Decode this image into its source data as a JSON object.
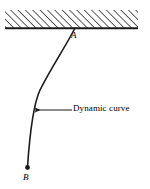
{
  "figure": {
    "background_color": "#ffffff",
    "stroke_color": "#1a1a1a",
    "width": 150,
    "height": 189,
    "wall": {
      "name": "hatched-ceiling",
      "hatch_direction": "forward-slash",
      "hatch_color": "#2a2a2a",
      "x_start": 5,
      "x_end": 138,
      "y_top": 10,
      "y_bottom": 28,
      "baseline_thickness": 2
    },
    "curve": {
      "name": "dynamic-curve",
      "path": "M 75 28 C 66 46, 52 66, 40 90 C 34 103, 30 130, 27.5 167",
      "stroke_width": 1.6,
      "start_point_label": "A",
      "end_point_label": "B"
    },
    "points": [
      {
        "id": "A",
        "label": "A",
        "x": 75,
        "y": 28,
        "marker": "none",
        "label_x": 71,
        "label_y": 31
      },
      {
        "id": "B",
        "label": "B",
        "x": 27.5,
        "y": 167,
        "marker": "filled-dot",
        "marker_radius": 2.4,
        "label_x": 23,
        "label_y": 173
      }
    ],
    "annotation": {
      "text": "Dynamic curve",
      "leader_line": {
        "name": "annotation-leader-line",
        "x_from": 72,
        "x_to": 33,
        "y": 110,
        "arrowhead": "left"
      },
      "text_x": 73,
      "text_y": 104
    }
  }
}
